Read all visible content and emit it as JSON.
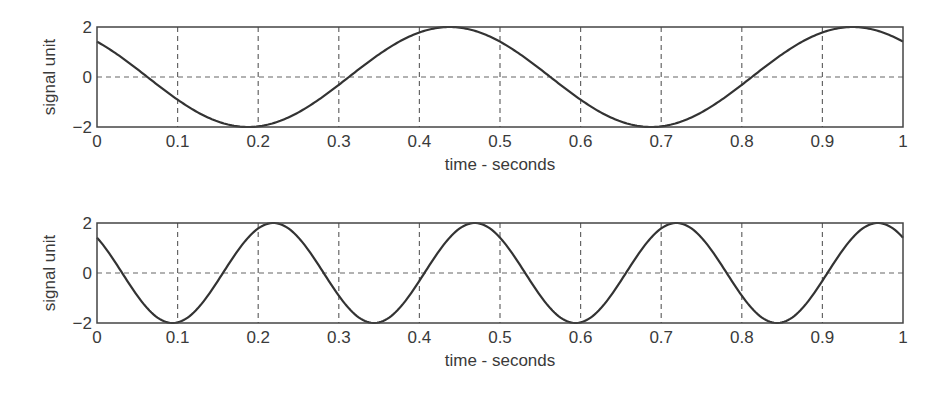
{
  "figure": {
    "width": 939,
    "height": 396,
    "colors": {
      "curve": "#333333",
      "axes": "#444444",
      "grid": "#666666",
      "text": "#3a3a3a",
      "background": "#ffffff"
    }
  },
  "chart_data": [
    {
      "type": "line",
      "title": "",
      "xlabel": "time - seconds",
      "ylabel": "signal unit",
      "xlim": [
        0,
        1
      ],
      "ylim": [
        -2,
        2
      ],
      "grid": true,
      "xticks": [
        0,
        0.1,
        0.2,
        0.3,
        0.4,
        0.5,
        0.6,
        0.7,
        0.8,
        0.9,
        1
      ],
      "xtick_labels": [
        "0",
        "0.1",
        "0.2",
        "0.3",
        "0.4",
        "0.5",
        "0.6",
        "0.7",
        "0.8",
        "0.9",
        "1"
      ],
      "yticks": [
        -2,
        0,
        2
      ],
      "ytick_labels": [
        "−2",
        "0",
        "2"
      ],
      "series": [
        {
          "name": "2 Hz sinusoid",
          "amplitude": 2,
          "frequency_hz": 2,
          "phase_rad": 0.7854,
          "x": [
            0,
            0.05,
            0.1,
            0.15,
            0.1875,
            0.2,
            0.25,
            0.3,
            0.35,
            0.4,
            0.4375,
            0.45,
            0.5,
            0.55,
            0.6,
            0.65,
            0.6875,
            0.7,
            0.75,
            0.8,
            0.85,
            0.9,
            0.9375,
            0.95,
            1
          ],
          "values": [
            1.41,
            0.0,
            -1.41,
            -1.95,
            -2.0,
            -1.98,
            -1.41,
            -0.31,
            0.91,
            1.78,
            2.0,
            1.98,
            1.41,
            0.0,
            -1.41,
            -1.95,
            -2.0,
            -1.98,
            -1.41,
            -0.31,
            0.91,
            1.78,
            2.0,
            1.98,
            1.41
          ]
        }
      ],
      "legend": null
    },
    {
      "type": "line",
      "title": "",
      "xlabel": "time - seconds",
      "ylabel": "signal unit",
      "xlim": [
        0,
        1
      ],
      "ylim": [
        -2,
        2
      ],
      "grid": true,
      "xticks": [
        0,
        0.1,
        0.2,
        0.3,
        0.4,
        0.5,
        0.6,
        0.7,
        0.8,
        0.9,
        1
      ],
      "xtick_labels": [
        "0",
        "0.1",
        "0.2",
        "0.3",
        "0.4",
        "0.5",
        "0.6",
        "0.7",
        "0.8",
        "0.9",
        "1"
      ],
      "yticks": [
        -2,
        0,
        2
      ],
      "ytick_labels": [
        "−2",
        "0",
        "2"
      ],
      "series": [
        {
          "name": "4 Hz sinusoid",
          "amplitude": 2,
          "frequency_hz": 4,
          "phase_rad": 0.7854,
          "x": [
            0,
            0.03125,
            0.0625,
            0.09375,
            0.125,
            0.15625,
            0.1875,
            0.21875,
            0.25,
            0.28125,
            0.3125,
            0.34375,
            0.375,
            0.40625,
            0.4375,
            0.46875,
            0.5,
            0.53125,
            0.5625,
            0.59375,
            0.625,
            0.65625,
            0.6875,
            0.71875,
            0.75,
            0.78125,
            0.8125,
            0.84375,
            0.875,
            0.90625,
            0.9375,
            0.96875,
            1
          ],
          "values": [
            1.41,
            0.0,
            -1.41,
            -2.0,
            -1.41,
            0.0,
            1.41,
            2.0,
            1.41,
            0.0,
            -1.41,
            -2.0,
            -1.41,
            0.0,
            1.41,
            2.0,
            1.41,
            0.0,
            -1.41,
            -2.0,
            -1.41,
            0.0,
            1.41,
            2.0,
            1.41,
            0.0,
            -1.41,
            -2.0,
            -1.41,
            0.0,
            1.41,
            2.0,
            1.41
          ]
        }
      ],
      "legend": null
    }
  ],
  "layout": {
    "plots": [
      {
        "left": 97,
        "top": 27,
        "width": 806,
        "height": 100
      },
      {
        "left": 97,
        "top": 223,
        "width": 806,
        "height": 100
      }
    ]
  }
}
